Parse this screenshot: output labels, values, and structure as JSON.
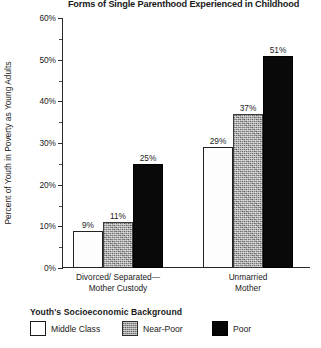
{
  "chart_data": {
    "type": "bar",
    "title": "Forms of Single Parenthood Experienced in Childhood",
    "xlabel": "",
    "ylabel": "Percent of Youth in Poverty as Young Adults",
    "ylim": [
      0,
      60
    ],
    "y_tick_labels": [
      "0%",
      "10%",
      "20%",
      "30%",
      "40%",
      "50%",
      "60%"
    ],
    "y_tick_values": [
      0,
      10,
      20,
      30,
      40,
      50,
      60
    ],
    "y_minor_tick_values": [
      5,
      15,
      25,
      35,
      45,
      55
    ],
    "grid": false,
    "legend_position": "bottom-left",
    "categories": [
      "Divorced/ Separated—\nMother Custody",
      "Unmarried\nMother"
    ],
    "category_lines": [
      [
        "Divorced/ Separated—",
        "Mother Custody"
      ],
      [
        "Unmarried",
        "Mother"
      ]
    ],
    "series": [
      {
        "name": "Middle Class",
        "values": [
          9,
          29
        ],
        "labels": [
          "9%",
          "29%"
        ],
        "fill": "#ffffff",
        "style": "solid-white"
      },
      {
        "name": "Near-Poor",
        "values": [
          11,
          37
        ],
        "labels": [
          "11%",
          "37%"
        ],
        "fill": "#a7a7a7",
        "style": "textured-gray"
      },
      {
        "name": "Poor",
        "values": [
          25,
          51
        ],
        "labels": [
          "25%",
          "51%"
        ],
        "fill": "#090909",
        "style": "solid-black"
      }
    ]
  },
  "legend": {
    "title": "Youth's  Socioeconomic Background",
    "items": [
      {
        "label": "Middle Class"
      },
      {
        "label": "Near-Poor"
      },
      {
        "label": "Poor"
      }
    ]
  },
  "colors": {
    "axis": "#2b2b2b",
    "text": "#1a1a1a",
    "background": "#ffffff"
  }
}
